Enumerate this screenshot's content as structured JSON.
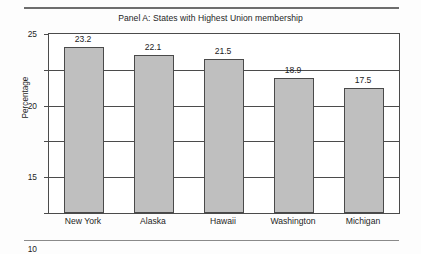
{
  "chart_data": {
    "type": "bar",
    "title": "Panel A: States with Highest Union membership",
    "xlabel": "",
    "ylabel": "Percentage",
    "categories": [
      "New York",
      "Alaska",
      "Hawaii",
      "Washington",
      "Michigan"
    ],
    "values": [
      23.2,
      22.1,
      21.5,
      18.9,
      17.5
    ],
    "value_labels": [
      "23.2",
      "22.1",
      "21.5",
      "18.9",
      "17.5"
    ],
    "ylim": [
      0,
      25
    ],
    "yticks": [
      0,
      5,
      10,
      15,
      20,
      25
    ],
    "ytick_labels": [
      "0",
      "5",
      "10",
      "15",
      "20",
      "25"
    ],
    "grid": true,
    "legend": "none",
    "bar_fill_color": "#bfbfbf",
    "bar_edge_color": "#4a4a4a",
    "axis_color": "#4b4b4b",
    "background_color": "#ffffff"
  },
  "decorations": {
    "top_rule_color": "#6d6d6d",
    "bottom_rule_color": "#8a8a8a"
  }
}
